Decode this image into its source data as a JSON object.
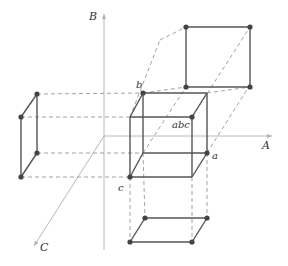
{
  "colors": {
    "solid": "#555555",
    "dashed": "#8a8a8a",
    "axis": "#b0b0b0",
    "dot": "#444444",
    "text": "#333333"
  },
  "axes": {
    "A": {
      "label": "A",
      "from": [
        104,
        136
      ],
      "to": [
        272,
        136
      ],
      "label_pos": [
        262,
        140
      ]
    },
    "B": {
      "label": "B",
      "from": [
        104,
        250
      ],
      "to": [
        104,
        14
      ],
      "label_pos": [
        89,
        11
      ]
    },
    "C": {
      "label": "C",
      "from": [
        104,
        136
      ],
      "to": [
        34,
        246
      ],
      "label_pos": [
        40,
        242
      ]
    }
  },
  "labels": [
    {
      "name": "vertex-label-b",
      "text": "b",
      "pos": [
        136,
        80
      ]
    },
    {
      "name": "vertex-label-abc",
      "text": "abc",
      "pos": [
        172,
        120
      ]
    },
    {
      "name": "vertex-label-a",
      "text": "a",
      "pos": [
        212,
        151
      ]
    },
    {
      "name": "vertex-label-c",
      "text": "c",
      "pos": [
        118,
        183
      ]
    }
  ],
  "cube": {
    "front": [
      [
        130,
        117
      ],
      [
        192,
        117
      ],
      [
        192,
        177
      ],
      [
        130,
        177
      ]
    ],
    "back": [
      [
        143,
        93
      ],
      [
        207,
        93
      ],
      [
        207,
        153
      ],
      [
        143,
        153
      ]
    ]
  },
  "projections": {
    "top": [
      [
        186,
        27
      ],
      [
        250,
        27
      ],
      [
        250,
        87
      ],
      [
        186,
        87
      ]
    ],
    "left": [
      [
        37,
        94
      ],
      [
        21,
        117
      ],
      [
        21,
        177
      ],
      [
        37,
        153
      ]
    ],
    "bottom": [
      [
        145,
        218
      ],
      [
        207,
        218
      ],
      [
        192,
        242
      ],
      [
        130,
        242
      ]
    ]
  },
  "dots": [
    [
      143,
      93
    ],
    [
      192,
      117
    ],
    [
      207,
      153
    ],
    [
      130,
      177
    ],
    [
      186,
      27
    ],
    [
      250,
      27
    ],
    [
      186,
      87
    ],
    [
      250,
      87
    ],
    [
      37,
      94
    ],
    [
      21,
      117
    ],
    [
      37,
      153
    ],
    [
      21,
      177
    ],
    [
      145,
      218
    ],
    [
      207,
      218
    ],
    [
      130,
      242
    ],
    [
      192,
      242
    ]
  ]
}
